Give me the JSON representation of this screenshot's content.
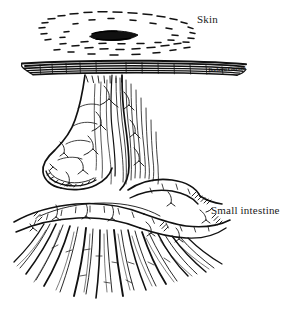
{
  "figure": {
    "background_color": "#ffffff",
    "ink_color": "#111111",
    "width": 291,
    "height": 311
  },
  "labels": {
    "skin": "Skin",
    "small_intestine": "Small intestine"
  },
  "signature": {
    "text": "Barbara Cousins"
  },
  "parts": [
    {
      "name": "skin-surface-layer",
      "label": "Skin"
    },
    {
      "name": "stoma-opening",
      "label": ""
    },
    {
      "name": "peristomal-stipple-ring",
      "label": ""
    },
    {
      "name": "everted-bowel-segment",
      "label": ""
    },
    {
      "name": "mesentery-vessels",
      "label": ""
    },
    {
      "name": "small-intestine-loops",
      "label": "Small intestine"
    },
    {
      "name": "mesentery-fan",
      "label": ""
    }
  ]
}
